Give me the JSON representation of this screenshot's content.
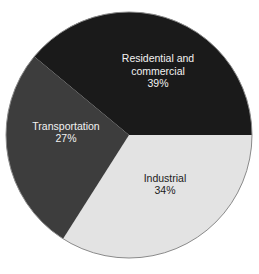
{
  "chart_data": {
    "type": "pie",
    "title": "",
    "subtitle": "",
    "xlabel": "",
    "ylabel": "",
    "grid": false,
    "legend_position": "none",
    "label_format": "name + percent",
    "units": "percent",
    "total": 100,
    "categories": [
      "Residential and commercial",
      "Industrial",
      "Transportation"
    ],
    "values": [
      39,
      34,
      27
    ],
    "slices": [
      {
        "name": "Residential and commercial",
        "label_line1": "Residential and",
        "label_line2": "commercial",
        "value": 39,
        "value_label": "39%",
        "color": "#1a1a1a",
        "text_color": "#f2f2f2",
        "start_angle_deg": 309.6,
        "end_angle_deg": 90.0,
        "sweep_deg": 140.4,
        "label_x": 158,
        "label_y": 72
      },
      {
        "name": "Industrial",
        "label_line1": "Industrial",
        "label_line2": "",
        "value": 34,
        "value_label": "34%",
        "color": "#e3e3e3",
        "text_color": "#1c1c1c",
        "start_angle_deg": 90.0,
        "end_angle_deg": 212.4,
        "sweep_deg": 122.4,
        "label_x": 165,
        "label_y": 185
      },
      {
        "name": "Transportation",
        "label_line1": "Transportation",
        "label_line2": "",
        "value": 27,
        "value_label": "27%",
        "color": "#3d3d3d",
        "text_color": "#f2f2f2",
        "start_angle_deg": 212.4,
        "end_angle_deg": 309.6,
        "sweep_deg": 97.2,
        "label_x": 66,
        "label_y": 133
      }
    ],
    "geometry": {
      "center_x": 129,
      "center_y": 135,
      "radius": 123,
      "background": "#ffffff",
      "outline_color": "#8a8a8a"
    }
  }
}
